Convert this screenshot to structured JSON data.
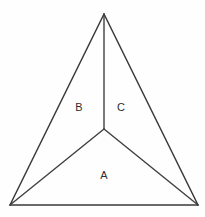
{
  "diagram": {
    "type": "geometric-figure",
    "background_color": "#fefefe",
    "stroke_color": "#3a3a3a",
    "label_color": "#2e2e2e",
    "canvas": {
      "width": 205,
      "height": 217
    },
    "vertices": {
      "apex": {
        "name": "apex",
        "x": 104,
        "y": 14
      },
      "bottom_left": {
        "name": "bottom-left",
        "x": 10,
        "y": 205
      },
      "bottom_right": {
        "name": "bottom-right",
        "x": 198,
        "y": 205
      },
      "interior": {
        "name": "interior-point",
        "x": 104,
        "y": 129
      }
    },
    "outer_edges": [
      {
        "name": "left-edge",
        "from": "apex",
        "to": "bottom_left"
      },
      {
        "name": "right-edge",
        "from": "apex",
        "to": "bottom_right"
      },
      {
        "name": "bottom-edge",
        "from": "bottom_left",
        "to": "bottom_right"
      }
    ],
    "cevians": [
      {
        "name": "cevian-to-apex",
        "from": "interior",
        "to": "apex"
      },
      {
        "name": "cevian-to-bottom-left",
        "from": "interior",
        "to": "bottom_left"
      },
      {
        "name": "cevian-to-bottom-right",
        "from": "interior",
        "to": "bottom_right"
      }
    ],
    "regions": [
      {
        "id": "A",
        "label": "A",
        "label_x": 104,
        "label_y": 176,
        "description": "bottom region bounded by bottom edge and two lower cevians"
      },
      {
        "id": "B",
        "label": "B",
        "label_x": 79,
        "label_y": 108,
        "description": "left region bounded by left edge, upper cevian and lower-left cevian"
      },
      {
        "id": "C",
        "label": "C",
        "label_x": 121,
        "label_y": 108,
        "description": "right region bounded by right edge, upper cevian and lower-right cevian"
      }
    ]
  }
}
